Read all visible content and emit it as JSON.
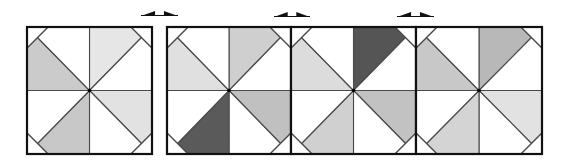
{
  "figure": {
    "title": "Pinwheel quilt block with three shading variations",
    "width": 566,
    "height": 161,
    "colors": {
      "background": "#ffffff",
      "border": "#111111",
      "inner_line": "#4a4a4a",
      "center_dot": "#000000",
      "white_patch": "#ffffff",
      "arrow": "#111111"
    },
    "corner_cut": 21,
    "panels": [
      {
        "id": "block-original",
        "x0": 27,
        "y0": 27,
        "x1": 152,
        "y1": 154,
        "fills": {
          "top_right_upper": "#e6e6e6",
          "bottom_right_right": "#e2e2e2",
          "bottom_left_lower": "#c8c8c8",
          "top_left_left": "#cbcbcb"
        }
      },
      {
        "id": "variation-1",
        "x0": 167,
        "y0": 27,
        "x1": 291,
        "y1": 154,
        "fills": {
          "top_right_upper": "#cfcfcf",
          "bottom_right_right": "#c0c0c0",
          "bottom_left_lower": "#5a5a5a",
          "top_left_left": "#e0e0e0"
        }
      },
      {
        "id": "variation-2",
        "x0": 291,
        "y0": 27,
        "x1": 416,
        "y1": 154,
        "fills": {
          "top_right_upper": "#555555",
          "bottom_right_right": "#c2c2c2",
          "bottom_left_lower": "#d0d0d0",
          "top_left_left": "#dcdcdc"
        }
      },
      {
        "id": "variation-3",
        "x0": 416,
        "y0": 27,
        "x1": 542,
        "y1": 154,
        "fills": {
          "top_right_upper": "#b8b8b8",
          "bottom_right_right": "#e2e2e2",
          "bottom_left_lower": "#d4d4d4",
          "top_left_left": "#c8c8c8"
        }
      }
    ],
    "arrows": [
      {
        "id": "swap-arrow-1",
        "x0": 141,
        "x1": 178,
        "baseline": 16,
        "top": 11
      },
      {
        "id": "swap-arrow-2",
        "x0": 274,
        "x1": 310,
        "baseline": 17,
        "top": 12
      },
      {
        "id": "swap-arrow-3",
        "x0": 397,
        "x1": 434,
        "baseline": 17,
        "top": 12
      }
    ]
  }
}
